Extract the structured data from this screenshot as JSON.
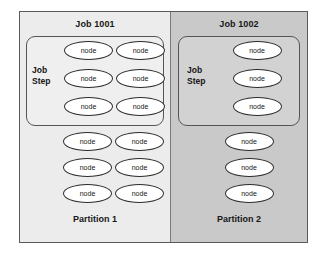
{
  "diagram": {
    "colors": {
      "page_background": "#ffffff",
      "frame_border": "#5a5a5a",
      "partition_1_background": "#ececec",
      "partition_2_background": "#c9c9c9",
      "job_step_1_background": "#efefef",
      "job_step_2_background": "#d2d2d2",
      "node_fill": "#ffffff",
      "node_border": "#2b2b2b",
      "text": "#171717"
    },
    "partitions": [
      {
        "id": "partition-1",
        "job_title": "Job 1001",
        "footer_label": "Partition 1",
        "job_step": {
          "label_line_1": "Job",
          "label_line_2": "Step",
          "columns": 2,
          "rows": 3,
          "nodes": [
            [
              "node",
              "node"
            ],
            [
              "node",
              "node"
            ],
            [
              "node",
              "node"
            ]
          ]
        },
        "free_nodes": {
          "columns": 2,
          "rows": 3,
          "nodes": [
            [
              "node",
              "node"
            ],
            [
              "node",
              "node"
            ],
            [
              "node",
              "node"
            ]
          ]
        }
      },
      {
        "id": "partition-2",
        "job_title": "Job 1002",
        "footer_label": "Partition 2",
        "job_step": {
          "label_line_1": "Job",
          "label_line_2": "Step",
          "columns": 1,
          "rows": 3,
          "nodes": [
            [
              "node"
            ],
            [
              "node"
            ],
            [
              "node"
            ]
          ]
        },
        "free_nodes": {
          "columns": 1,
          "rows": 3,
          "nodes": [
            [
              "node"
            ],
            [
              "node"
            ],
            [
              "node"
            ]
          ]
        }
      }
    ]
  }
}
